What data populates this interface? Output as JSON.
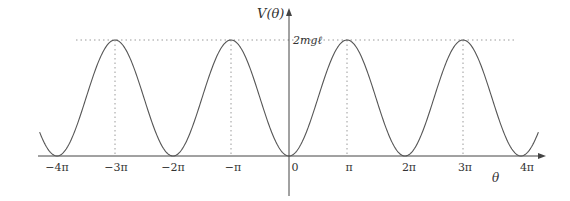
{
  "chart_data": {
    "type": "line",
    "title": "",
    "xlabel": "θ",
    "ylabel": "V(θ)",
    "function": "V(θ) = mgℓ(1 − cos θ)",
    "x_tick_labels": [
      "−4π",
      "−3π",
      "−2π",
      "−π",
      "0",
      "π",
      "2π",
      "3π",
      "4π"
    ],
    "x_ticks_in_pi": [
      -4,
      -3,
      -2,
      -1,
      0,
      1,
      2,
      3,
      4
    ],
    "y_tick_labels": [
      "2mgℓ"
    ],
    "y_ticks_in_mgl": [
      2
    ],
    "xlim_in_pi": [
      -4.3,
      4.3
    ],
    "ylim_in_mgl": [
      0,
      2
    ],
    "series": [
      {
        "name": "V(θ)",
        "x_in_pi": [
          -4.3,
          -4,
          -3.5,
          -3,
          -2.5,
          -2,
          -1.5,
          -1,
          -0.5,
          0,
          0.5,
          1,
          1.5,
          2,
          2.5,
          3,
          3.5,
          4,
          4.3
        ],
        "y_in_mgl": [
          0.41,
          0,
          1,
          2,
          1,
          0,
          1,
          2,
          1,
          0,
          1,
          2,
          1,
          0,
          1,
          2,
          1,
          0,
          0.41
        ]
      }
    ],
    "maxima_in_pi": [
      -3,
      -1,
      1,
      3
    ],
    "minima_in_pi": [
      -4,
      -2,
      0,
      2,
      4
    ],
    "annotations": [
      "dotted horizontal line at V = 2mgℓ",
      "dotted vertical lines at θ = −3π, −π, π, 3π"
    ],
    "grid": false,
    "legend": null
  },
  "labels": {
    "y_axis": "V(θ)",
    "x_axis": "θ",
    "y_max": "2mgℓ",
    "x_ticks": [
      "−4π",
      "−3π",
      "−2π",
      "−π",
      "0",
      "π",
      "2π",
      "3π",
      "4π"
    ]
  },
  "colors": {
    "curve": "#555555",
    "axis": "#444444",
    "dotted": "#9a9a9a"
  }
}
